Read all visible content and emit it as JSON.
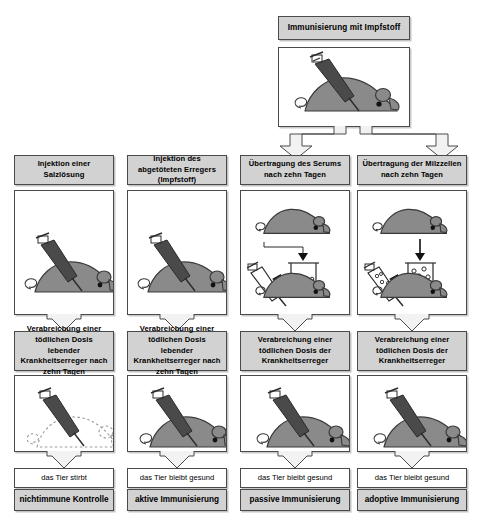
{
  "diagram": {
    "title_box": {
      "label": "Immunisierung mit Impfstoff"
    },
    "colors": {
      "box_fill": "#d2d2d2",
      "panel_fill": "#ffffff",
      "outline": "#4a4a4a",
      "mouse_fill": "#8a8a8a",
      "mouse_outline": "#3a3a3a",
      "syringe_fill": "#4a4a4a",
      "arrow_fill": "#f2f2f2"
    },
    "columns": [
      {
        "id": "column-1-nonimmune",
        "header": "Injektion einer Salzlösung",
        "illustration_top": "mouse-injected-with-saline",
        "treatment": "Verabreichung einer tödlichen Dosis lebender Krankheitserreger nach zehn Tagen",
        "illustration_bottom": "dead-mouse-dashed-outline-with-syringe",
        "outcome": "das Tier stirbt",
        "conclusion": "nichtimmune Kontrolle",
        "receives_from_immunization": false
      },
      {
        "id": "column-2-active",
        "header": "Injektion des abgetöteten Erregers (Impfstoff)",
        "illustration_top": "mouse-injected-with-killed-pathogen",
        "treatment": "Verabreichung einer tödlichen Dosis lebender Krankheitserreger nach zehn Tagen",
        "illustration_bottom": "healthy-mouse-with-syringe",
        "outcome": "das Tier bleibt gesund",
        "conclusion": "aktive Immunisierung",
        "receives_from_immunization": false
      },
      {
        "id": "column-3-passive",
        "header": "Übertragung des Serums nach zehn Tagen",
        "illustration_top": "serum-transfer-donor-mouse-beaker-recipient-mouse",
        "treatment": "Verabreichung einer tödlichen Dosis der Krankheitserreger",
        "illustration_bottom": "healthy-mouse-with-syringe",
        "outcome": "das Tier bleibt gesund",
        "conclusion": "passive Immunisierung",
        "receives_from_immunization": true
      },
      {
        "id": "column-4-adoptive",
        "header": "Übertragung der Milzzellen nach zehn Tagen",
        "illustration_top": "spleen-cell-transfer-donor-mouse-beaker-recipient-mouse",
        "treatment": "Verabreichung einer tödlichen Dosis der Krankheitserreger",
        "illustration_bottom": "healthy-mouse-with-syringe",
        "outcome": "das Tier bleibt gesund",
        "conclusion": "adoptive Immunisierung",
        "receives_from_immunization": true
      }
    ]
  }
}
